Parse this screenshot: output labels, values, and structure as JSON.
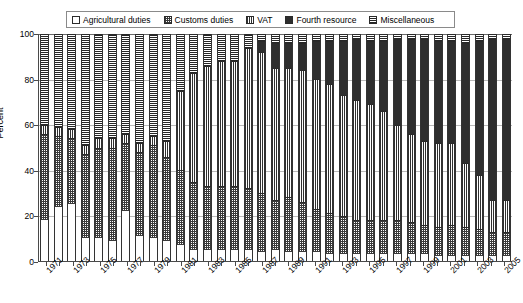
{
  "chart_data": {
    "type": "bar",
    "stacked": true,
    "normalized": true,
    "title": "",
    "xlabel": "",
    "ylabel": "Percent",
    "ylim": [
      0,
      100
    ],
    "yticks": [
      0,
      20,
      40,
      60,
      80,
      100
    ],
    "grid": true,
    "legend_position": "top",
    "legend_entries": [
      "Agricultural duties",
      "Customs duties",
      "VAT",
      "Fourth resource",
      "Miscellaneous"
    ],
    "categories": [
      "1971",
      "1972",
      "1973",
      "1974",
      "1975",
      "1976",
      "1977",
      "1978",
      "1979",
      "1980",
      "1981",
      "1982",
      "1983",
      "1984",
      "1985",
      "1986",
      "1987",
      "1988",
      "1989",
      "1990",
      "1991",
      "1992",
      "1993",
      "1994",
      "1995",
      "1996",
      "1997",
      "1998",
      "1999",
      "2000",
      "2001",
      "2002",
      "2003",
      "2004",
      "2005"
    ],
    "tick_labels": [
      "1971",
      "",
      "1973",
      "",
      "1975",
      "",
      "1977",
      "",
      "1979",
      "",
      "1981",
      "",
      "1983",
      "",
      "1985",
      "",
      "1987",
      "",
      "1989",
      "",
      "1991",
      "",
      "1993",
      "",
      "1995",
      "",
      "1997",
      "",
      "1999",
      "",
      "2001",
      "",
      "2003",
      "",
      "2005"
    ],
    "series": [
      {
        "name": "Agricultural duties",
        "pattern": "light-dotted",
        "values": [
          18,
          24,
          25,
          10,
          10,
          9,
          22,
          11,
          10,
          9,
          7,
          5,
          5,
          5,
          5,
          5,
          4,
          5,
          4,
          4,
          4,
          3,
          3,
          3,
          3,
          3,
          3,
          3,
          3,
          2,
          2,
          2,
          2,
          2,
          2
        ]
      },
      {
        "name": "Customs duties",
        "pattern": "fine-crosshatch",
        "values": [
          38,
          31,
          29,
          37,
          40,
          41,
          30,
          37,
          41,
          37,
          33,
          30,
          28,
          28,
          28,
          27,
          26,
          22,
          24,
          22,
          19,
          18,
          17,
          15,
          15,
          15,
          15,
          14,
          13,
          13,
          14,
          13,
          12,
          11,
          11
        ]
      },
      {
        "name": "VAT",
        "pattern": "vertical-lines",
        "values": [
          4,
          4,
          4,
          4,
          4,
          4,
          4,
          4,
          4,
          7,
          35,
          48,
          53,
          55,
          55,
          62,
          62,
          58,
          57,
          58,
          57,
          57,
          53,
          53,
          51,
          48,
          42,
          39,
          37,
          37,
          36,
          28,
          24,
          14,
          14
        ]
      },
      {
        "name": "Fourth resource",
        "pattern": "solid-dark",
        "values": [
          0,
          0,
          0,
          0,
          0,
          0,
          0,
          0,
          0,
          0,
          0,
          0,
          0,
          0,
          0,
          0,
          5,
          11,
          11,
          12,
          17,
          19,
          24,
          27,
          28,
          31,
          38,
          42,
          45,
          45,
          45,
          53,
          59,
          71,
          71
        ]
      },
      {
        "name": "Miscellaneous",
        "pattern": "horizontal-lines",
        "values": [
          40,
          41,
          42,
          49,
          46,
          46,
          44,
          48,
          45,
          47,
          25,
          17,
          14,
          12,
          12,
          6,
          3,
          4,
          4,
          4,
          3,
          3,
          3,
          2,
          3,
          3,
          2,
          2,
          2,
          3,
          3,
          4,
          3,
          2,
          2
        ]
      }
    ]
  },
  "axes": {
    "y_label": "Percent",
    "y_ticks": [
      "0",
      "20",
      "40",
      "60",
      "80",
      "100"
    ]
  },
  "colors": {
    "agricultural": "#ffffff",
    "customs": "#3a3a3a",
    "vat": "#303030",
    "fourth_resource": "#2e2e2e",
    "miscellaneous": "#262626",
    "grid": "#b9b9b9",
    "axis": "#4a4a4a",
    "text": "#000000"
  }
}
